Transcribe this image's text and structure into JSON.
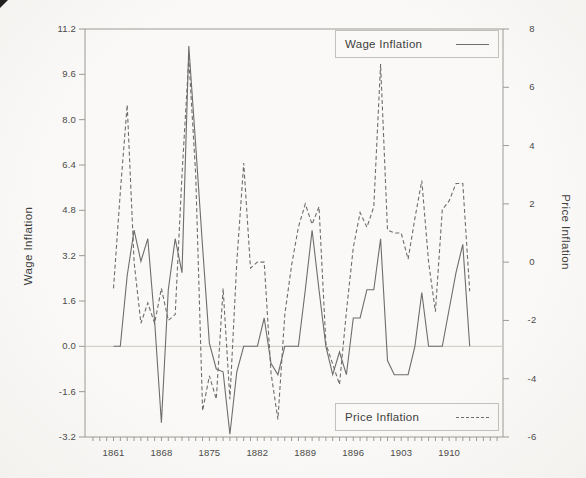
{
  "figure": {
    "background": "#faf9f7",
    "line_color": "#6d6d6b",
    "axis_color": "#9b9a96",
    "zero_line_color": "#c9c8c2",
    "text_color": "#3e3e3c"
  },
  "left_axis": {
    "title": "Wage Inflation",
    "tick_labels": [
      "11.2",
      "9.6",
      "8.0",
      "6.4",
      "4.8",
      "3.2",
      "1.6",
      "0.0",
      "-1.6",
      "-3.2"
    ]
  },
  "right_axis": {
    "title": "Price Inflation",
    "tick_labels": [
      "8",
      "6",
      "4",
      "2",
      "0",
      "-2",
      "-4",
      "-6"
    ]
  },
  "x_axis": {
    "tick_labels": [
      "1861",
      "1868",
      "1875",
      "1882",
      "1889",
      "1896",
      "1903",
      "1910"
    ]
  },
  "legends": {
    "wage": {
      "label": "Wage Inflation",
      "style": "solid"
    },
    "price": {
      "label": "Price Inflation",
      "style": "dashed"
    }
  },
  "chart_data": {
    "type": "line",
    "title": "",
    "x_start": 1861,
    "x_end": 1913,
    "x_tick_labels": [
      1861,
      1868,
      1875,
      1882,
      1889,
      1896,
      1903,
      1910
    ],
    "left_ylim": [
      -3.2,
      11.2
    ],
    "right_ylim": [
      -6,
      8
    ],
    "grid": "zero-line only",
    "legend_position": "boxed, top-right and lower-right inside plot",
    "series": [
      {
        "name": "Wage Inflation",
        "axis": "left",
        "style": "solid",
        "values": [
          0.0,
          0.0,
          2.5,
          4.1,
          3.0,
          3.8,
          0.9,
          -2.7,
          2.0,
          3.8,
          2.6,
          10.6,
          7.1,
          3.5,
          0.1,
          -0.8,
          -0.9,
          -3.1,
          -0.9,
          0.0,
          0.0,
          0.0,
          1.0,
          -0.6,
          -1.0,
          0.0,
          0.0,
          0.0,
          2.0,
          4.1,
          2.0,
          0.0,
          -1.0,
          -0.2,
          -1.0,
          1.0,
          1.0,
          2.0,
          2.0,
          3.8,
          -0.5,
          -1.0,
          -1.0,
          -1.0,
          0.0,
          1.9,
          0.0,
          0.0,
          0.0,
          1.3,
          2.6,
          3.6,
          0.0
        ]
      },
      {
        "name": "Price Inflation",
        "axis": "right",
        "style": "dashed",
        "values": [
          -0.9,
          2.4,
          5.4,
          0.0,
          -2.1,
          -1.4,
          -2.1,
          -0.9,
          -2.0,
          -1.8,
          3.0,
          7.0,
          3.0,
          -5.1,
          -3.9,
          -4.7,
          -0.9,
          -4.7,
          0.0,
          3.4,
          -0.2,
          0.0,
          0.0,
          -3.8,
          -5.4,
          -1.8,
          -0.1,
          1.2,
          2.0,
          1.3,
          1.9,
          -2.8,
          -3.5,
          -4.2,
          -1.7,
          0.5,
          1.7,
          1.2,
          1.9,
          6.8,
          1.1,
          1.0,
          1.0,
          0.1,
          1.5,
          2.8,
          0.0,
          -1.7,
          1.8,
          2.1,
          2.7,
          2.7,
          -1.0
        ]
      }
    ]
  }
}
